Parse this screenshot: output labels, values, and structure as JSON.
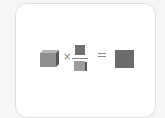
{
  "diagram": {
    "operators": {
      "times": "×",
      "equals": "="
    },
    "colors": {
      "background": "#f6f6f6",
      "card": "#ffffff",
      "card_border": "#e0e0e0",
      "cube_front": "#8f8f8f",
      "cube_side": "#555555",
      "numerator": "#6f6f6f",
      "denominator": "#9d9d9d",
      "result": "#6b6b6b"
    },
    "terms": [
      {
        "shape": "cube-icon"
      },
      {
        "shape": "fraction",
        "numerator": "square-icon",
        "denominator": "cube-icon"
      },
      {
        "shape": "square-icon"
      }
    ]
  }
}
